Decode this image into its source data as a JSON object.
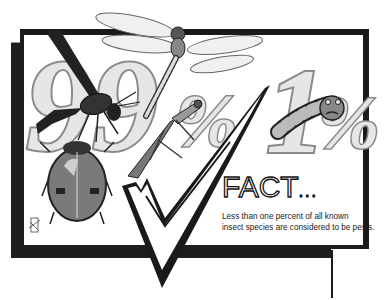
{
  "illustration": {
    "left_number": "99%",
    "right_number": "1%",
    "insects": [
      "wasp",
      "dragonfly",
      "ladybug",
      "praying-mantis",
      "grub"
    ],
    "colors": {
      "frame": "#1a1a1a",
      "shadow": "#222222",
      "number_fill": "#e6e6e6",
      "number_outline": "#8a8a8a",
      "background": "#ffffff"
    }
  },
  "fact": {
    "title": "FACT",
    "dots": "...",
    "caption_line1": "Less than one percent of all known",
    "caption_line2": "insect species are considered to be pests."
  }
}
